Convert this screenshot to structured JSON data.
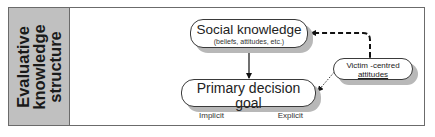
{
  "side_label": {
    "lines": [
      "Evaluative",
      "knowledge",
      "structure"
    ]
  },
  "nodes": {
    "social": {
      "title": "Social knowledge",
      "subtitle": "(beliefs, attitudes, etc.)"
    },
    "primary": {
      "title": "Primary decision goal",
      "left_label": "Implicit",
      "right_label": "Explicit"
    },
    "victim": {
      "line1": "Victim -centred",
      "line2": "attitudes"
    }
  },
  "edges": [
    {
      "from": "social",
      "to": "primary",
      "style": "solid"
    },
    {
      "from": "victim",
      "to": "social",
      "style": "dashed",
      "bidirectional": true
    },
    {
      "from": "victim",
      "to": "primary",
      "style": "dotted"
    }
  ],
  "colors": {
    "side_fill": "#c0c0c0",
    "border": "#6b6b6b",
    "shadow": "#b8b8b8"
  }
}
